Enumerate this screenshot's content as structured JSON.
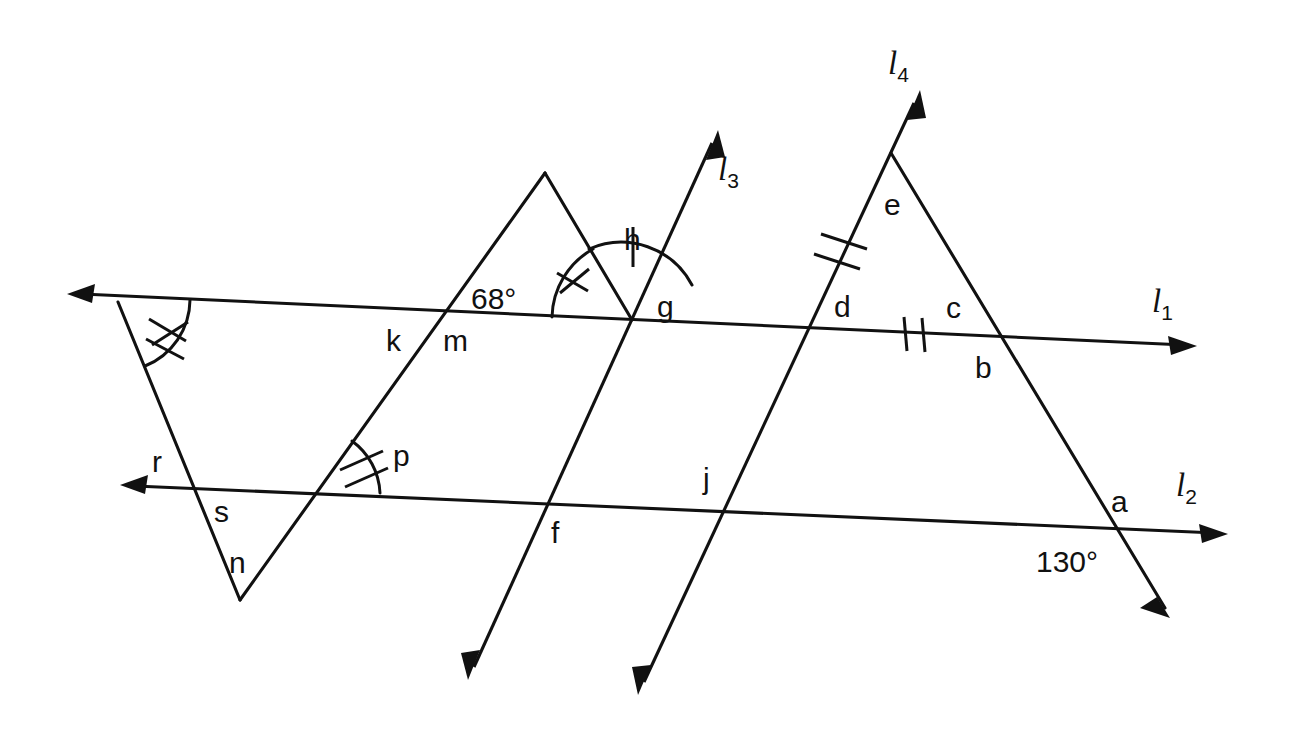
{
  "figure": {
    "background_color": "#ffffff",
    "stroke_color": "#111111",
    "width": 1292,
    "height": 744
  },
  "lines": [
    {
      "id": "l1",
      "label": "l",
      "subscript": "1",
      "label_x": 1152,
      "label_y": 312,
      "description": "horizontal transversal, arrowheads both ends"
    },
    {
      "id": "l2",
      "label": "l",
      "subscript": "2",
      "label_x": 1176,
      "label_y": 496,
      "description": "lower horizontal transversal, arrowheads both ends"
    },
    {
      "id": "l3",
      "label": "l",
      "subscript": "3",
      "label_x": 718,
      "label_y": 180,
      "description": "steep line rising to upper right, arrowheads both ends"
    },
    {
      "id": "l4",
      "label": "l",
      "subscript": "4",
      "label_x": 888,
      "label_y": 74,
      "description": "steep line rising to upper right through apex e, arrowheads both ends"
    }
  ],
  "point_labels": [
    {
      "name": "a",
      "text": "a",
      "x": 1111,
      "y": 512
    },
    {
      "name": "b",
      "text": "b",
      "x": 975,
      "y": 378
    },
    {
      "name": "c",
      "text": "c",
      "x": 946,
      "y": 318
    },
    {
      "name": "d",
      "text": "d",
      "x": 834,
      "y": 317
    },
    {
      "name": "e",
      "text": "e",
      "x": 884,
      "y": 215
    },
    {
      "name": "f",
      "text": "f",
      "x": 551,
      "y": 543
    },
    {
      "name": "g",
      "text": "g",
      "x": 657,
      "y": 317
    },
    {
      "name": "h",
      "text": "h",
      "x": 624,
      "y": 250
    },
    {
      "name": "j",
      "text": "j",
      "x": 703,
      "y": 489
    },
    {
      "name": "k",
      "text": "k",
      "x": 386,
      "y": 351
    },
    {
      "name": "m",
      "text": "m",
      "x": 443,
      "y": 351
    },
    {
      "name": "n",
      "text": "n",
      "x": 229,
      "y": 573
    },
    {
      "name": "p",
      "text": "p",
      "x": 393,
      "y": 466
    },
    {
      "name": "r",
      "text": "r",
      "x": 152,
      "y": 472
    },
    {
      "name": "s",
      "text": "s",
      "x": 214,
      "y": 522
    }
  ],
  "angle_values": [
    {
      "name": "angle-68",
      "text": "68°",
      "x": 471,
      "y": 309
    },
    {
      "name": "angle-130",
      "text": "130°",
      "x": 1036,
      "y": 572
    }
  ],
  "geometry": {
    "l1": {
      "x1": 67,
      "y1": 294,
      "x2": 1197,
      "y2": 346
    },
    "l2": {
      "x1": 120,
      "y1": 485,
      "x2": 1228,
      "y2": 534
    },
    "l3": {
      "x1": 718,
      "y1": 130,
      "x2": 468,
      "y2": 680
    },
    "l4": {
      "x1": 920,
      "y1": 90,
      "x2": 638,
      "y2": 695
    },
    "left_triangle": {
      "apex_left_x": 118,
      "apex_left_y": 302,
      "bottom_x": 240,
      "bottom_y": 600,
      "right_x": 632,
      "right_y": 320
    },
    "mid_triangle_peak": {
      "x": 545,
      "y": 173
    },
    "right_triangle": {
      "apex_x": 891,
      "apex_y": 153,
      "left_x": 760,
      "left_y": 437,
      "right_x": 1165,
      "right_y": 615
    }
  },
  "marks": {
    "double_tick_angles": [
      "left-vertex-angle",
      "p-angle"
    ],
    "single_tick_angles": [
      "g-angle",
      "h-angle"
    ],
    "segment_double_ticks": [
      "de-segment",
      "l1-dc-segment"
    ]
  }
}
